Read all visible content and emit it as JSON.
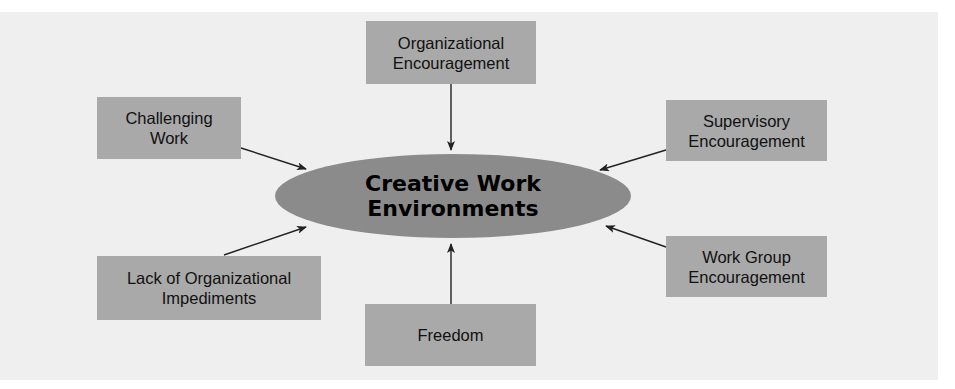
{
  "diagram": {
    "center": {
      "line1": "Creative Work",
      "line2": "Environments"
    },
    "nodes": [
      {
        "id": "organizational-encouragement",
        "line1": "Organizational",
        "line2": "Encouragement",
        "position": "top"
      },
      {
        "id": "challenging-work",
        "line1": "Challenging",
        "line2": "Work",
        "position": "upper-left"
      },
      {
        "id": "supervisory-encouragement",
        "line1": "Supervisory",
        "line2": "Encouragement",
        "position": "upper-right"
      },
      {
        "id": "lack-of-organizational-impediments",
        "line1": "Lack of Organizational",
        "line2": "Impediments",
        "position": "lower-left"
      },
      {
        "id": "work-group-encouragement",
        "line1": "Work Group",
        "line2": "Encouragement",
        "position": "lower-right"
      },
      {
        "id": "freedom",
        "line1": "Freedom",
        "line2": "",
        "position": "bottom"
      }
    ],
    "edges": [
      {
        "from": "organizational-encouragement",
        "to": "center"
      },
      {
        "from": "challenging-work",
        "to": "center"
      },
      {
        "from": "supervisory-encouragement",
        "to": "center"
      },
      {
        "from": "lack-of-organizational-impediments",
        "to": "center"
      },
      {
        "from": "work-group-encouragement",
        "to": "center"
      },
      {
        "from": "freedom",
        "to": "center"
      }
    ],
    "colors": {
      "background": "#efefef",
      "box_fill": "#a9a9a9",
      "ellipse_fill": "#8b8b8b",
      "text": "#111111",
      "arrow": "#222222"
    }
  }
}
